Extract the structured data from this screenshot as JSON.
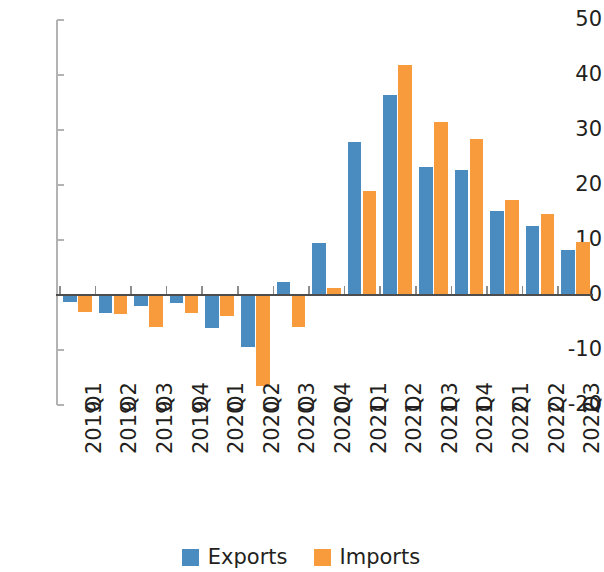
{
  "chart_data": {
    "type": "bar",
    "title": "",
    "subtitle": "",
    "xlabel": "",
    "ylabel": "",
    "ylim": [
      -20,
      50
    ],
    "yticks": [
      50,
      40,
      30,
      20,
      10,
      0,
      -10,
      -20
    ],
    "ytick_labels": [
      "50",
      "40",
      "30",
      "20",
      "10",
      "0",
      "-10",
      "-20"
    ],
    "grid": false,
    "legend_position": "bottom-center",
    "categories": [
      "2019 Q1",
      "2019 Q2",
      "2019 Q3",
      "2019 Q4",
      "2020 Q1",
      "2020 Q2",
      "2020 Q3",
      "2020 Q4",
      "2021 Q1",
      "2021 Q2",
      "2021 Q3",
      "2021 Q4",
      "2022 Q1",
      "2022 Q2",
      "2022 Q3"
    ],
    "category_lines": [
      [
        "2019",
        "Q1"
      ],
      [
        "2019",
        "Q2"
      ],
      [
        "2019",
        "Q3"
      ],
      [
        "2019",
        "Q4"
      ],
      [
        "2020",
        "Q1"
      ],
      [
        "2020",
        "Q2"
      ],
      [
        "2020",
        "Q3"
      ],
      [
        "2020",
        "Q4"
      ],
      [
        "2021",
        "Q1"
      ],
      [
        "2021",
        "Q2"
      ],
      [
        "2021",
        "Q3"
      ],
      [
        "2021",
        "Q4"
      ],
      [
        "2022",
        "Q1"
      ],
      [
        "2022",
        "Q2"
      ],
      [
        "2022",
        "Q3"
      ]
    ],
    "series": [
      {
        "name": "Exports",
        "color": "#4a8cc0",
        "values": [
          -1.3,
          -3.3,
          -2.0,
          -1.5,
          -6.0,
          -9.5,
          2.3,
          9.5,
          27.8,
          36.4,
          23.2,
          22.7,
          15.3,
          12.6,
          8.2
        ]
      },
      {
        "name": "Imports",
        "color": "#f89b3c",
        "values": [
          -3.0,
          -3.5,
          -5.8,
          -3.3,
          -3.8,
          -16.5,
          -5.8,
          1.2,
          18.9,
          41.8,
          31.4,
          28.4,
          17.3,
          14.7,
          9.7
        ]
      }
    ]
  },
  "legend": {
    "entries": [
      {
        "label": "Exports",
        "color": "#4a8cc0"
      },
      {
        "label": "Imports",
        "color": "#f89b3c"
      }
    ]
  },
  "colors": {
    "exports": "#4a8cc0",
    "imports": "#f89b3c",
    "axis": "#4d4d4d",
    "spine": "#b3b3b3",
    "text": "#231f20",
    "background": "#ffffff"
  }
}
